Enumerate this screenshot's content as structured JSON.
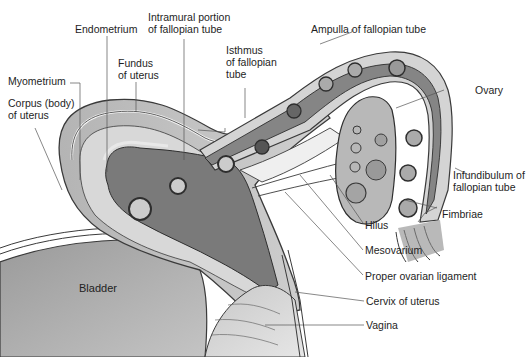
{
  "diagram": {
    "type": "anatomical-illustration",
    "colors": {
      "background": "#ffffff",
      "uterine_wall": "#c8c8c8",
      "endometrium_cavity": "#7a7a7a",
      "tube_lumen": "#858585",
      "ovary": "#b8b8b8",
      "bladder": "#a8a8a8",
      "outline": "#3a3a3a",
      "leader_line": "#555555"
    },
    "labels": {
      "endometrium": "Endometrium",
      "intramural": "Intramural portion\nof fallopian tube",
      "fundus": "Fundus\nof uterus",
      "isthmus": "Isthmus\nof fallopian\ntube",
      "ampulla": "Ampulla of fallopian tube",
      "myometrium": "Myometrium",
      "corpus": "Corpus (body)\nof uterus",
      "ovary": "Ovary",
      "infundibulum": "Infundibulum of\nfallopian tube",
      "fimbriae": "Fimbriae",
      "hilus": "Hilus",
      "mesovarium": "Mesovarium",
      "proper_ovarian_ligament": "Proper ovarian ligament",
      "cervix": "Cervix of uterus",
      "vagina": "Vagina",
      "bladder": "Bladder"
    }
  }
}
